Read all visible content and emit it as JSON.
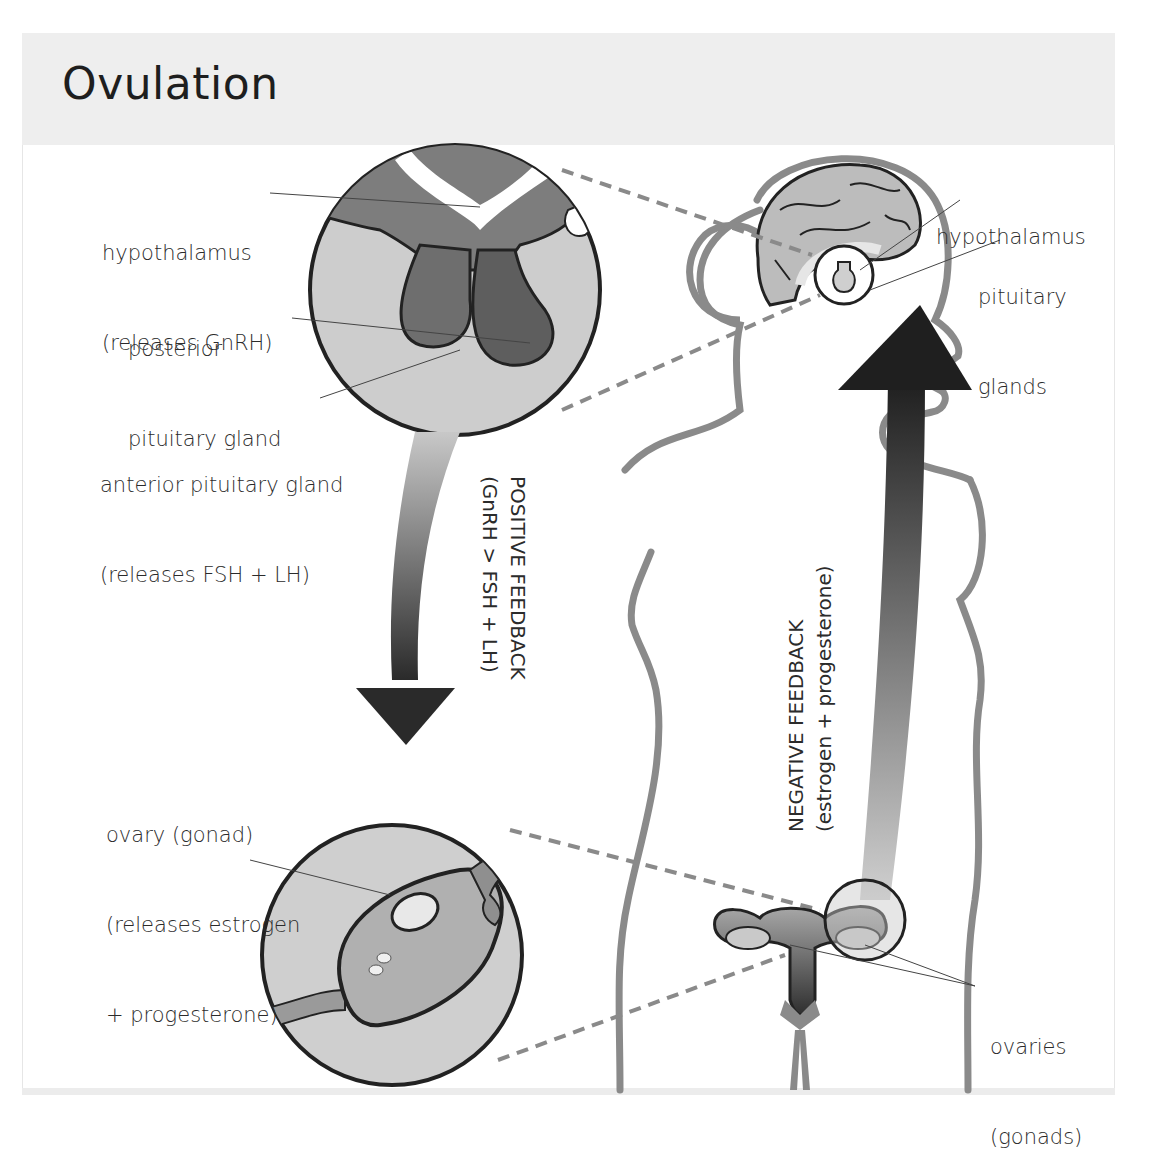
{
  "title": "Ovulation",
  "labels": {
    "hypothalamus_left": {
      "line1": "hypothalamus",
      "line2": "(releases GnRH)"
    },
    "posterior_pituitary": {
      "line1": "posterior",
      "line2": "pituitary gland"
    },
    "anterior_pituitary": {
      "line1": "anterior pituitary gland",
      "line2": "(releases FSH + LH)"
    },
    "hypothalamus_right": {
      "line1": "hypothalamus"
    },
    "pituitary_glands": {
      "line1": "pituitary",
      "line2": "glands"
    },
    "ovary_left": {
      "line1": "ovary (gonad)",
      "line2": "(releases estrogen",
      "line3": "+ progesterone)"
    },
    "ovaries_right": {
      "line1": "ovaries",
      "line2": "(gonads)"
    }
  },
  "feedback": {
    "positive": {
      "line1": "POSITIVE  FEEDBACK",
      "line2": "(GnRH > FSH + LH)"
    },
    "negative": {
      "line1": "NEGATIVE  FEEDBACK",
      "line2": "(estrogen + progesterone)"
    }
  },
  "colors": {
    "header_bg": "#eeeeee",
    "outline": "#7a7a7a",
    "dark": "#222222",
    "gland": "#6e6e6e",
    "circle_fill": "#cfcfcf"
  }
}
